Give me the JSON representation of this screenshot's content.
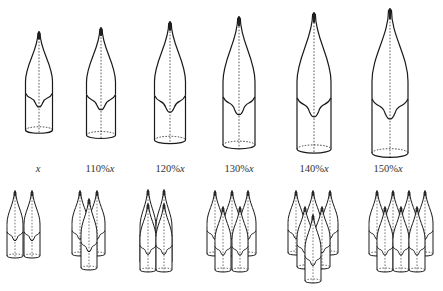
{
  "figure": {
    "stroke_color": "#1a1a1a",
    "background": "#ffffff",
    "top_row": {
      "description": "Single bottle-shaped tips scaled by percentage of base size x",
      "items": [
        {
          "label_pre": "",
          "label_var": "x",
          "cx": 39,
          "top": 33,
          "bottom": 130,
          "width": 27
        },
        {
          "label_pre": "110%",
          "label_var": "x",
          "cx": 101,
          "top": 29,
          "bottom": 135,
          "width": 29
        },
        {
          "label_pre": "120%",
          "label_var": "x",
          "cx": 170,
          "top": 23,
          "bottom": 140,
          "width": 31
        },
        {
          "label_pre": "130%",
          "label_var": "x",
          "cx": 239,
          "top": 18,
          "bottom": 145,
          "width": 32
        },
        {
          "label_pre": "140%",
          "label_var": "x",
          "cx": 314,
          "top": 14,
          "bottom": 149,
          "width": 34
        },
        {
          "label_pre": "150%",
          "label_var": "x",
          "cx": 390,
          "top": 10,
          "bottom": 153,
          "width": 36
        }
      ]
    },
    "labels": [
      {
        "pre": "",
        "var": "x",
        "cx": 38
      },
      {
        "pre": "110%",
        "var": "x",
        "cx": 100
      },
      {
        "pre": "120%",
        "var": "x",
        "cx": 170
      },
      {
        "pre": "130%",
        "var": "x",
        "cx": 239
      },
      {
        "pre": "140%",
        "var": "x",
        "cx": 314
      },
      {
        "pre": "150%",
        "var": "x",
        "cx": 388
      }
    ],
    "bottom_row": {
      "description": "Clustered arrangements of small bottle shapes",
      "shape_width": 16,
      "clusters": [
        {
          "count": 2,
          "shapes": [
            {
              "cx": 15,
              "top": 192,
              "bottom": 256
            },
            {
              "cx": 32,
              "top": 192,
              "bottom": 256
            }
          ]
        },
        {
          "count": 3,
          "shapes": [
            {
              "cx": 80,
              "top": 192,
              "bottom": 254
            },
            {
              "cx": 97,
              "top": 192,
              "bottom": 254
            },
            {
              "cx": 89,
              "top": 200,
              "bottom": 268
            }
          ]
        },
        {
          "count": 4,
          "shapes": [
            {
              "cx": 148,
              "top": 191,
              "bottom": 262
            },
            {
              "cx": 164,
              "top": 191,
              "bottom": 262
            },
            {
              "cx": 148,
              "top": 205,
              "bottom": 270
            },
            {
              "cx": 164,
              "top": 205,
              "bottom": 270
            }
          ]
        },
        {
          "count": 5,
          "shapes": [
            {
              "cx": 215,
              "top": 192,
              "bottom": 254
            },
            {
              "cx": 232,
              "top": 192,
              "bottom": 254
            },
            {
              "cx": 248,
              "top": 192,
              "bottom": 254
            },
            {
              "cx": 223,
              "top": 208,
              "bottom": 270
            },
            {
              "cx": 240,
              "top": 208,
              "bottom": 270
            }
          ]
        },
        {
          "count": 6,
          "shapes": [
            {
              "cx": 296,
              "top": 192,
              "bottom": 253
            },
            {
              "cx": 313,
              "top": 192,
              "bottom": 253
            },
            {
              "cx": 330,
              "top": 192,
              "bottom": 253
            },
            {
              "cx": 305,
              "top": 208,
              "bottom": 267
            },
            {
              "cx": 322,
              "top": 208,
              "bottom": 267
            },
            {
              "cx": 313,
              "top": 216,
              "bottom": 281
            }
          ]
        },
        {
          "count": 7,
          "shapes": [
            {
              "cx": 377,
              "top": 192,
              "bottom": 254
            },
            {
              "cx": 393,
              "top": 192,
              "bottom": 254
            },
            {
              "cx": 409,
              "top": 192,
              "bottom": 254
            },
            {
              "cx": 425,
              "top": 192,
              "bottom": 254
            },
            {
              "cx": 385,
              "top": 208,
              "bottom": 270
            },
            {
              "cx": 401,
              "top": 208,
              "bottom": 270
            },
            {
              "cx": 417,
              "top": 208,
              "bottom": 270
            }
          ]
        }
      ]
    }
  }
}
